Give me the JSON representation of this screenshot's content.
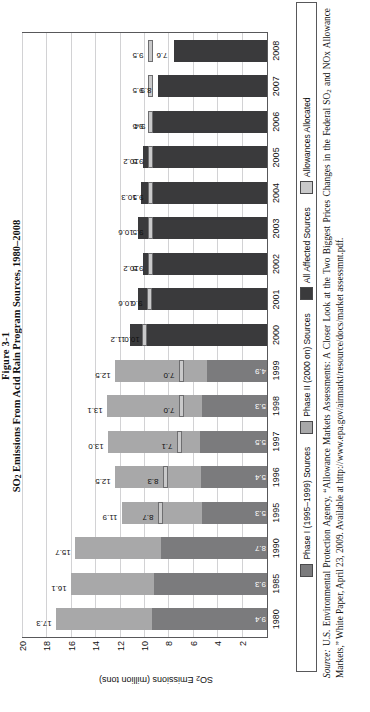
{
  "figure": {
    "number": "Figure 3-1",
    "title_pre": "SO",
    "title_sub": "2",
    "title_post": " Emissions From Acid Rain Program Sources, 1980–2008"
  },
  "axis": {
    "ylabel_pre": "SO",
    "ylabel_sub": "2",
    "ylabel_post": " Emissions (million tons)",
    "yticks": [
      "20",
      "18",
      "16",
      "14",
      "12",
      "10",
      "8",
      "6",
      "4",
      "2"
    ]
  },
  "legend": {
    "items": [
      {
        "label": "Phase I (1995–1999) Sources",
        "color": "#7b7b7d",
        "icon": "legend-swatch-phase-i"
      },
      {
        "label": "Phase II (2000 on) Sources",
        "color": "#a8a8a9",
        "icon": "legend-swatch-phase-ii"
      },
      {
        "label": "All Affected Sources",
        "color": "#3a3a3c",
        "icon": "legend-swatch-all-affected"
      },
      {
        "label": "Allowances Allocated",
        "color": "#c9c9ca",
        "icon": "legend-swatch-allowances"
      }
    ]
  },
  "source": {
    "prefix": "Source:",
    "text_a": " U.S. Environmental Protection Agency, “Allowance Markets Assessments: A Closer Look at the Two Biggest Prices Changes in the Federal SO",
    "sub": "2",
    "text_b": " and NOx Allowance Markets,” White Paper, April 23, 2009. Available at http://www.epa.gov/airmarkt/resource/docs/market assessmnt.pdf."
  },
  "chart_data": {
    "type": "bar",
    "title": "SO2 Emissions From Acid Rain Program Sources, 1980–2008",
    "xlabel": "",
    "ylabel": "SO2 Emissions (million tons)",
    "ylim": [
      0,
      20
    ],
    "ytick_step": 2,
    "grid": true,
    "legend_position": "bottom",
    "stacked": true,
    "categories": [
      "1980",
      "1985",
      "1990",
      "1995",
      "1996",
      "1997",
      "1998",
      "1999",
      "2000",
      "2001",
      "2002",
      "2003",
      "2004",
      "2005",
      "2006",
      "2007",
      "2008"
    ],
    "series": [
      {
        "name": "Phase I (1995–1999) Sources",
        "values": [
          9.4,
          9.3,
          8.7,
          5.3,
          5.4,
          5.5,
          5.3,
          4.9,
          null,
          null,
          null,
          null,
          null,
          null,
          null,
          null,
          null
        ]
      },
      {
        "name": "Phase II (2000 on) Sources",
        "values": [
          7.9,
          6.8,
          7.0,
          6.6,
          7.1,
          7.5,
          7.8,
          7.6,
          null,
          null,
          null,
          null,
          null,
          null,
          null,
          null,
          null
        ]
      },
      {
        "name": "All Affected Sources",
        "values": [
          null,
          null,
          null,
          null,
          null,
          null,
          null,
          null,
          11.2,
          10.6,
          10.2,
          10.6,
          10.3,
          10.2,
          9.4,
          8.9,
          7.6
        ]
      },
      {
        "name": "Allowances Allocated",
        "values": [
          null,
          null,
          null,
          8.7,
          8.3,
          7.1,
          7.0,
          7.0,
          10.0,
          9.6,
          9.5,
          9.5,
          9.5,
          9.5,
          9.5,
          9.5,
          9.5
        ]
      }
    ],
    "totals": [
      17.3,
      16.1,
      15.7,
      11.9,
      12.5,
      13.0,
      13.1,
      12.5,
      11.2,
      10.6,
      10.2,
      10.6,
      10.3,
      10.2,
      9.4,
      8.9,
      7.6
    ],
    "total_labels": [
      "17.3",
      "16.1",
      "15.7",
      "11.9",
      "12.5",
      "13.0",
      "13.1",
      "12.5",
      "11.2",
      "10.6",
      "10.2",
      "10.6",
      "10.3",
      "10.2",
      "9.4",
      "8.9",
      "7.6"
    ],
    "phase_i_labels": [
      "9.4",
      "9.3",
      "8.7",
      "5.3",
      "5.4",
      "5.5",
      "5.3",
      "4.9",
      "",
      "",
      "",
      "",
      "",
      "",
      "",
      "",
      ""
    ],
    "allowance_labels": [
      "",
      "",
      "",
      "8.7",
      "8.3",
      "7.1",
      "7.0",
      "7.0",
      "10.0",
      "9.6",
      "9.5",
      "9.5",
      "9.5",
      "9.5",
      "9.5",
      "9.5",
      "9.5"
    ]
  }
}
